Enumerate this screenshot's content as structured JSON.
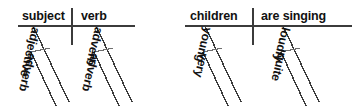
{
  "figure": {
    "type": "reed-kellogg-sentence-diagram",
    "background_color": "#ffffff",
    "line_color": "#3b3b3b",
    "text_color": "#111111",
    "count": 2
  },
  "diagrams": [
    {
      "id": "template-diagram",
      "name": "generic-pattern",
      "baseline": {
        "x1": 18,
        "x2": 135,
        "y": 26
      },
      "divider": {
        "x": 72,
        "y1": 8,
        "y2": 44
      },
      "subject_slot": {
        "label": "subject",
        "x": 24,
        "y": 10
      },
      "predicate_slot": {
        "label": "verb",
        "x": 82,
        "y": 10
      },
      "modifiers": [
        {
          "label": "adjective",
          "attaches_to": "subject",
          "level": 1
        },
        {
          "label": "adverb",
          "attaches_to": "adjective",
          "level": 2
        },
        {
          "label": "adverb",
          "attaches_to": "verb",
          "level": 1
        },
        {
          "label": "adverb",
          "attaches_to": "adverb",
          "level": 2
        }
      ]
    },
    {
      "id": "example-diagram",
      "name": "example-sentence",
      "baseline": {
        "x1": 185,
        "x2": 352,
        "y": 26
      },
      "divider": {
        "x": 253,
        "y1": 8,
        "y2": 44
      },
      "subject_slot": {
        "label": "children",
        "x": 193,
        "y": 10
      },
      "predicate_slot": {
        "label": "are singing",
        "x": 262,
        "y": 10
      },
      "modifiers": [
        {
          "label": "young",
          "attaches_to": "children",
          "level": 1
        },
        {
          "label": "very",
          "attaches_to": "young",
          "level": 2
        },
        {
          "label": "loudly",
          "attaches_to": "are singing",
          "level": 1
        },
        {
          "label": "quite",
          "attaches_to": "loudly",
          "level": 2
        }
      ]
    }
  ],
  "labels": {
    "left_subject": "subject",
    "left_verb": "verb",
    "left_adjective": "adjective",
    "left_adverb_under_adjective": "adverb",
    "left_adverb_under_verb": "adverb",
    "left_adverb_under_adverb": "adverb",
    "right_subject": "children",
    "right_verb": "are singing",
    "right_adjective": "young",
    "right_adverb_under_adjective": "very",
    "right_adverb_under_verb": "loudly",
    "right_adverb_under_adverb": "quite"
  }
}
